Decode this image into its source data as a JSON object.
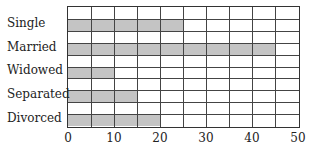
{
  "chart_data": {
    "type": "bar",
    "orientation": "horizontal",
    "title": "",
    "xlabel": "",
    "ylabel": "",
    "categories": [
      "Single",
      "Married",
      "Widowed",
      "Separated",
      "Divorced"
    ],
    "values": [
      25,
      45,
      10,
      15,
      20
    ],
    "xlim": [
      0,
      50
    ],
    "x_ticks": [
      "0",
      "10",
      "20",
      "30",
      "40",
      "50"
    ],
    "grid": true,
    "bar_color": "#c4c4c4"
  }
}
